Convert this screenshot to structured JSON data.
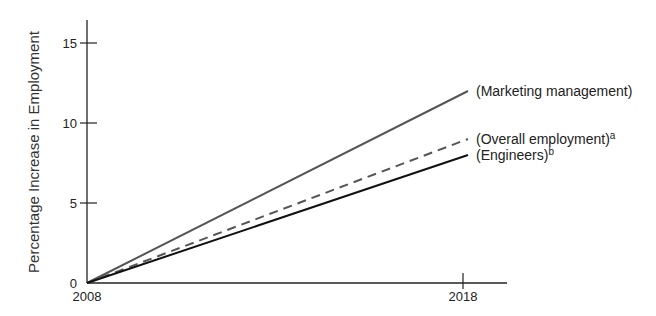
{
  "chart_data": {
    "type": "line",
    "title": "",
    "xlabel": "",
    "ylabel": "Percentage Increase in Employment",
    "x": [
      2008,
      2018
    ],
    "x_tick_labels": [
      "2008",
      "2018"
    ],
    "y_ticks": [
      0,
      5,
      10,
      15
    ],
    "ylim": [
      0,
      16.5
    ],
    "grid": false,
    "legend_position": "inline-right",
    "series": [
      {
        "name": "(Marketing management)",
        "superscript": "",
        "values": [
          0,
          12
        ],
        "style": "solid",
        "color": "#555555"
      },
      {
        "name": "(Overall employment)",
        "superscript": "a",
        "values": [
          0,
          9
        ],
        "style": "dashed",
        "color": "#555555"
      },
      {
        "name": "(Engineers)",
        "superscript": "b",
        "values": [
          0,
          8
        ],
        "style": "solid",
        "color": "#111111"
      }
    ]
  }
}
